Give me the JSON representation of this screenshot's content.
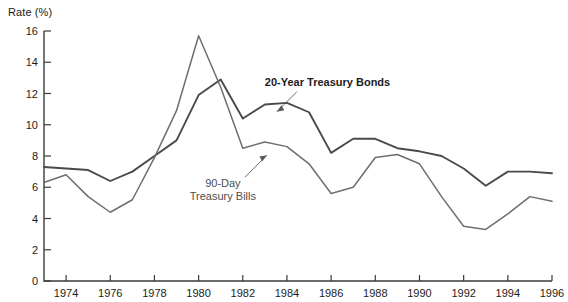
{
  "chart_data": {
    "type": "line",
    "title": "",
    "ylabel": "Rate (%)",
    "xlabel": "",
    "ylim": [
      0,
      16
    ],
    "xlim": [
      1973,
      1996
    ],
    "y_ticks": [
      0,
      2,
      4,
      6,
      8,
      10,
      12,
      14,
      16
    ],
    "x_ticks": [
      1974,
      1976,
      1978,
      1980,
      1982,
      1984,
      1986,
      1988,
      1990,
      1992,
      1994,
      1996
    ],
    "x_tick_labels": [
      "1974",
      "1976",
      "1978",
      "1980",
      "1982",
      "1984",
      "1986",
      "1988",
      "1990",
      "1992",
      "1994",
      "1996"
    ],
    "y_tick_labels": [
      "0",
      "2",
      "4",
      "6",
      "8",
      "10",
      "12",
      "14",
      "16"
    ],
    "grid": false,
    "legend_position": "inline-annotations",
    "x": [
      1973,
      1974,
      1975,
      1976,
      1977,
      1978,
      1979,
      1980,
      1981,
      1982,
      1983,
      1984,
      1985,
      1986,
      1987,
      1988,
      1989,
      1990,
      1991,
      1992,
      1993,
      1994,
      1995,
      1996
    ],
    "series": [
      {
        "name": "20-Year Treasury Bonds",
        "color": "#4a4a4a",
        "width": 1.9,
        "values": [
          7.3,
          7.2,
          7.1,
          6.4,
          7.0,
          8.0,
          9.0,
          11.9,
          12.9,
          10.4,
          11.3,
          11.4,
          10.8,
          8.2,
          9.1,
          9.1,
          8.5,
          8.3,
          8.0,
          7.2,
          6.1,
          7.0,
          7.0,
          6.9
        ]
      },
      {
        "name": "90-Day Treasury Bills",
        "color": "#6e6e6e",
        "width": 1.5,
        "values": [
          6.3,
          6.8,
          5.4,
          4.4,
          5.2,
          7.9,
          10.9,
          15.7,
          12.4,
          8.5,
          8.9,
          8.6,
          7.5,
          5.6,
          6.0,
          7.9,
          8.1,
          7.5,
          5.4,
          3.5,
          3.3,
          4.3,
          5.4,
          5.1
        ]
      }
    ],
    "annotations": [
      {
        "name": "bonds-annotation",
        "text": "20-Year Treasury Bonds",
        "lines": [
          "20-Year Treasury Bonds"
        ],
        "style": "bold",
        "x": 1983.0,
        "y": 12.5
      },
      {
        "name": "bills-annotation",
        "text": "90-Day Treasury Bills",
        "lines": [
          "90-Day",
          "Treasury Bills"
        ],
        "style": "light",
        "x": 1981.1,
        "y": 6.0
      }
    ]
  }
}
